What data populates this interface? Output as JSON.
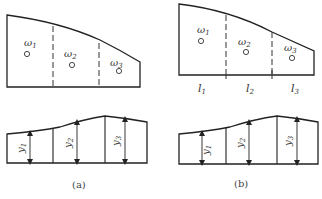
{
  "figure": {
    "panels": [
      {
        "id": "a",
        "caption": "(a)",
        "top": {
          "outline_color": "#222222",
          "regions": [
            {
              "label": "ω",
              "subscript": "1"
            },
            {
              "label": "ω",
              "subscript": "2"
            },
            {
              "label": "ω",
              "subscript": "3"
            }
          ],
          "dividers": [
            "dashed",
            "dashed"
          ]
        },
        "bottom": {
          "ordinates": [
            {
              "label": "y",
              "subscript": "1"
            },
            {
              "label": "y",
              "subscript": "2"
            },
            {
              "label": "y",
              "subscript": "3"
            }
          ],
          "dividers": [
            "solid",
            "solid"
          ]
        }
      },
      {
        "id": "b",
        "caption": "(b)",
        "top": {
          "outline_color": "#222222",
          "regions": [
            {
              "label": "ω",
              "subscript": "1"
            },
            {
              "label": "ω",
              "subscript": "2"
            },
            {
              "label": "ω",
              "subscript": "3"
            }
          ],
          "dividers": [
            "dashed",
            "solid"
          ],
          "spans": [
            {
              "label": "l",
              "subscript": "1"
            },
            {
              "label": "l",
              "subscript": "2"
            },
            {
              "label": "l",
              "subscript": "3"
            }
          ]
        },
        "bottom": {
          "ordinates": [
            {
              "label": "y",
              "subscript": "1"
            },
            {
              "label": "y",
              "subscript": "2"
            },
            {
              "label": "y",
              "subscript": "3"
            }
          ],
          "dividers": [
            "solid",
            "solid"
          ]
        }
      }
    ]
  }
}
